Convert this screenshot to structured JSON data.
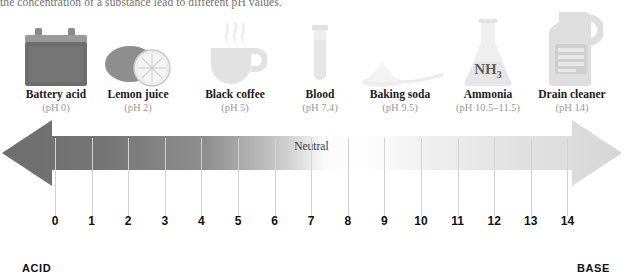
{
  "intro_text": "the concentration of a substance lead to different pH values.",
  "substances": [
    {
      "name": "Battery acid",
      "ph_label": "(pH 0)",
      "icon": "car-battery-icon",
      "x": 1,
      "tone": "#6d6d6d"
    },
    {
      "name": "Lemon juice",
      "ph_label": "(pH 2)",
      "icon": "lemon-icon",
      "x": 83,
      "tone": "#8e8e8e"
    },
    {
      "name": "Black coffee",
      "ph_label": "(pH 5)",
      "icon": "coffee-cup-icon",
      "x": 180,
      "tone": "#e2e2e2"
    },
    {
      "name": "Blood",
      "ph_label": "(pH 7.4)",
      "icon": "blood-test-tube-icon",
      "x": 265,
      "tone": "#ececec"
    },
    {
      "name": "Baking soda",
      "ph_label": "(pH 9.5)",
      "icon": "baking-soda-spoon-icon",
      "x": 345,
      "tone": "#efefef"
    },
    {
      "name": "Ammonia",
      "ph_label": "(pH 10.5–11.5)",
      "icon": "ammonia-flask-icon",
      "x": 433,
      "tone": "#ebebeb"
    },
    {
      "name": "Drain cleaner",
      "ph_label": "(pH 14)",
      "icon": "drain-cleaner-jug-icon",
      "x": 517,
      "tone": "#e2e2e2"
    }
  ],
  "flask_formula": {
    "base": "NH",
    "subscript": "3"
  },
  "scale": {
    "acid_label": "ACID",
    "base_label": "BASE",
    "neutral_label": "Neutral",
    "ticks": [
      "0",
      "1",
      "2",
      "3",
      "4",
      "5",
      "6",
      "7",
      "8",
      "9",
      "10",
      "11",
      "12",
      "13",
      "14"
    ],
    "tick_start_x": 55,
    "tick_spacing": 36.6,
    "neutral_value": "7"
  },
  "colors": {
    "acid_dark": "#6e6e6e",
    "mid_white": "#ffffff",
    "base_gray": "#d9d9d9",
    "tick_line": "#d2d2d2",
    "text_dark": "#111111",
    "text_muted": "#9a9a9a"
  }
}
